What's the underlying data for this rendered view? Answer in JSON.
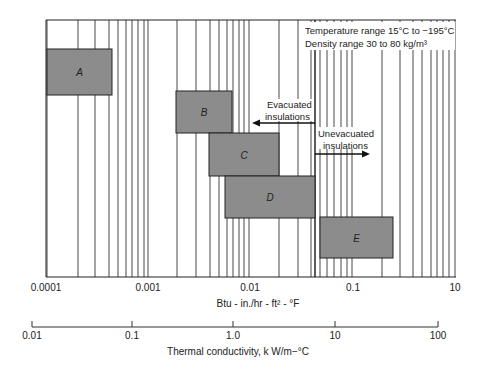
{
  "chart_data": {
    "type": "bar",
    "subtype": "horizontal-range (log scale)",
    "title": "",
    "annotations": {
      "temperature": "Temperature range 15°C to −195°C",
      "density": "Density range 30 to 80 kg/m³",
      "evacuated": [
        "Evacuated",
        "insulations"
      ],
      "unevacuated": [
        "Unevacuated",
        "insulations"
      ]
    },
    "xlabel": "Btu - in./hr - ft² - °F",
    "xscale": "log",
    "xticks": [
      "0.0001",
      "0.001",
      "0.01",
      "0.1",
      "10"
    ],
    "secondary_axis": {
      "label": "Thermal conductivity, k W/m−°C",
      "ticks": [
        "0.01",
        "0.1",
        "1.0",
        "10",
        "100"
      ]
    },
    "grid": true,
    "categories": [
      "A",
      "B",
      "C",
      "D",
      "E"
    ],
    "series": [
      {
        "name": "A",
        "x_range": [
          0.0001,
          0.00045
        ]
      },
      {
        "name": "B",
        "x_range": [
          0.0025,
          0.0085
        ]
      },
      {
        "name": "C",
        "x_range": [
          0.0053,
          0.027
        ]
      },
      {
        "name": "D",
        "x_range": [
          0.0075,
          0.07
        ]
      },
      {
        "name": "E",
        "x_range": [
          0.065,
          0.4
        ]
      }
    ],
    "colors": {
      "box": "#8c8c8c",
      "grid": "#333333",
      "border": "#222222"
    }
  }
}
